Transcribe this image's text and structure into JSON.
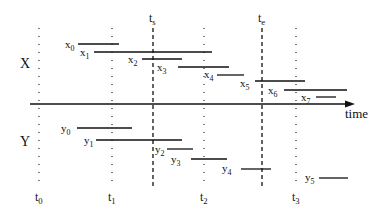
{
  "diagram": {
    "axis": {
      "label": "time",
      "y": 104,
      "x_start": 30,
      "x_end": 355
    },
    "series_labels": [
      {
        "name": "X",
        "x": 20,
        "y": 68
      },
      {
        "name": "Y",
        "x": 20,
        "y": 146
      }
    ],
    "time_marks": [
      {
        "name": "t0",
        "base": "t",
        "sub": "0",
        "x": 39,
        "style": "dotted",
        "label_pos": "bottom"
      },
      {
        "name": "t1",
        "base": "t",
        "sub": "1",
        "x": 112,
        "style": "dotted",
        "label_pos": "bottom"
      },
      {
        "name": "ts",
        "base": "t",
        "sub": "s",
        "x": 153,
        "style": "dashed",
        "label_pos": "top"
      },
      {
        "name": "t2",
        "base": "t",
        "sub": "2",
        "x": 204,
        "style": "dotted",
        "label_pos": "bottom"
      },
      {
        "name": "te",
        "base": "t",
        "sub": "e",
        "x": 262,
        "style": "dashed",
        "label_pos": "top"
      },
      {
        "name": "t3",
        "base": "t",
        "sub": "3",
        "x": 296,
        "style": "dotted",
        "label_pos": "bottom"
      }
    ],
    "x_intervals": [
      {
        "base": "x",
        "sub": "0",
        "label_x": 65,
        "label_y": 48,
        "x1": 78,
        "x2": 119,
        "y": 44
      },
      {
        "base": "x",
        "sub": "1",
        "label_x": 80,
        "label_y": 56,
        "x1": 94,
        "x2": 212,
        "y": 52
      },
      {
        "base": "x",
        "sub": "2",
        "label_x": 128,
        "label_y": 63,
        "x1": 142,
        "x2": 182,
        "y": 59
      },
      {
        "base": "x",
        "sub": "3",
        "label_x": 157,
        "label_y": 71,
        "x1": 178,
        "x2": 229,
        "y": 67
      },
      {
        "base": "x",
        "sub": "4",
        "label_x": 204,
        "label_y": 78,
        "x1": 217,
        "x2": 244,
        "y": 75
      },
      {
        "base": "x",
        "sub": "5",
        "label_x": 240,
        "label_y": 87,
        "x1": 255,
        "x2": 305,
        "y": 81
      },
      {
        "base": "x",
        "sub": "6",
        "label_x": 268,
        "label_y": 94,
        "x1": 284,
        "x2": 347,
        "y": 90
      },
      {
        "base": "x",
        "sub": "7",
        "label_x": 301,
        "label_y": 101,
        "x1": 316,
        "x2": 336,
        "y": 97
      }
    ],
    "y_intervals": [
      {
        "base": "y",
        "sub": "0",
        "label_x": 61,
        "label_y": 132,
        "x1": 77,
        "x2": 132,
        "y": 128
      },
      {
        "base": "y",
        "sub": "1",
        "label_x": 84,
        "label_y": 144,
        "x1": 96,
        "x2": 182,
        "y": 140
      },
      {
        "base": "y",
        "sub": "2",
        "label_x": 155,
        "label_y": 153,
        "x1": 167,
        "x2": 193,
        "y": 149
      },
      {
        "base": "y",
        "sub": "3",
        "label_x": 171,
        "label_y": 163,
        "x1": 191,
        "x2": 227,
        "y": 159
      },
      {
        "base": "y",
        "sub": "4",
        "label_x": 222,
        "label_y": 172,
        "x1": 241,
        "x2": 271,
        "y": 169
      },
      {
        "base": "y",
        "sub": "5",
        "label_x": 305,
        "label_y": 181,
        "x1": 319,
        "x2": 348,
        "y": 178
      }
    ]
  }
}
